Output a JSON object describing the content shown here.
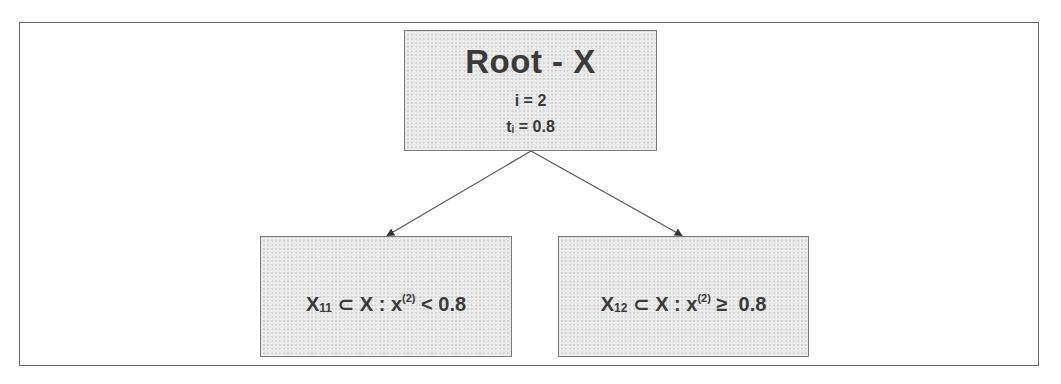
{
  "diagram": {
    "type": "decision-tree",
    "root": {
      "title": "Root - X",
      "split_feature_line": "i = 2",
      "threshold_symbol": "t",
      "threshold_subscript": "i",
      "threshold_rest": " = 0.8"
    },
    "children": [
      {
        "set_symbol": "X",
        "set_subscript": "11",
        "relation_prefix": " ⊂ X : x",
        "feature_superscript": "(2)",
        "condition": " < 0.8"
      },
      {
        "set_symbol": "X",
        "set_subscript": "12",
        "relation_prefix": " ⊂ X : x",
        "feature_superscript": "(2)",
        "condition": " ≥  0.8"
      }
    ],
    "edges": [
      {
        "from": "root",
        "to": "left-child"
      },
      {
        "from": "root",
        "to": "right-child"
      }
    ],
    "colors": {
      "node_fill": "#e9e9e9",
      "node_border": "#7a7a7a",
      "text": "#3a3a3a",
      "edge": "#555555",
      "frame": "#6a6a6a"
    }
  }
}
